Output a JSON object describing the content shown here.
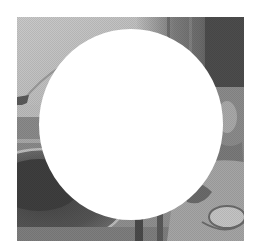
{
  "image": {
    "description": "Grayscale still-life photograph (tableware, plate and cup, curtain backdrop) with a large white circular cut-out mask over the center",
    "photo_bounds": {
      "x": 17,
      "y": 17,
      "width": 227,
      "height": 224
    },
    "mask": {
      "shape": "circle",
      "fill": "#ffffff",
      "center_x": 131,
      "center_y": 125,
      "width": 184,
      "height": 191
    },
    "colors": {
      "background": "#ffffff",
      "light_gray": "#c8c8c8",
      "mid_gray": "#8c8c8c",
      "dark_gray": "#4a4a4a",
      "darkest": "#333333"
    },
    "regions": [
      {
        "name": "top-left-wall",
        "tone": "light"
      },
      {
        "name": "top-right-curtain",
        "tone": "dark"
      },
      {
        "name": "left-plate",
        "tone": "dark"
      },
      {
        "name": "bottom-right-cup",
        "tone": "mid"
      }
    ]
  }
}
